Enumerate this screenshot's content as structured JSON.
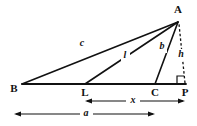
{
  "figure": {
    "background_color": "#ffffff",
    "ink_color": "#111111",
    "vertices": [
      {
        "id": "A",
        "label": "A",
        "x": 178,
        "y": 22,
        "label_x": 178,
        "label_y": 10
      },
      {
        "id": "B",
        "label": "B",
        "x": 22,
        "y": 84,
        "label_x": 14,
        "label_y": 89
      },
      {
        "id": "L",
        "label": "L",
        "x": 85,
        "y": 84,
        "label_x": 85,
        "label_y": 93
      },
      {
        "id": "C",
        "label": "C",
        "x": 155,
        "y": 84,
        "label_x": 155,
        "label_y": 93
      },
      {
        "id": "P",
        "label": "P",
        "x": 185,
        "y": 84,
        "label_x": 185,
        "label_y": 93
      }
    ],
    "edges": [
      {
        "id": "baseline",
        "name": "baseline-BP",
        "from": "B",
        "to": "P",
        "style": "solid",
        "label": ""
      },
      {
        "id": "BA",
        "name": "segment-B-to-A",
        "from": "B",
        "to": "A",
        "style": "solid",
        "label": "c",
        "label_x": 82,
        "label_y": 44
      },
      {
        "id": "LA",
        "name": "segment-L-to-A",
        "from": "L",
        "to": "A",
        "style": "solid",
        "label": "l",
        "label_x": 125,
        "label_y": 56
      },
      {
        "id": "CA",
        "name": "segment-C-to-A",
        "from": "C",
        "to": "A",
        "style": "solid",
        "label": "b",
        "label_x": 162,
        "label_y": 47
      },
      {
        "id": "PA",
        "name": "altitude-P-to-A",
        "from": "P",
        "to": "A",
        "style": "dashed",
        "label": "h",
        "label_x": 181,
        "label_y": 55
      }
    ],
    "right_angle": {
      "at_vertex": "P",
      "name": "right-angle-marker-at-P",
      "size": 7
    },
    "dimensions": [
      {
        "id": "x",
        "label": "x",
        "name": "dimension-x",
        "from_vertex": "L",
        "to_vertex": "P",
        "x1": 85,
        "x2": 185,
        "y": 101,
        "label_x": 133,
        "label_y": 101
      },
      {
        "id": "a",
        "label": "a",
        "name": "dimension-a",
        "from_vertex": "B",
        "to_vertex": "C",
        "x1": 14,
        "x2": 155,
        "y": 114,
        "label_x": 86,
        "label_y": 114
      }
    ]
  }
}
